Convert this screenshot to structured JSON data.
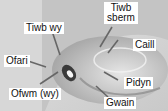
{
  "figure": {
    "labels": [
      {
        "id": "tiwb-wy",
        "text": "Tiwb wy"
      },
      {
        "id": "tiwb-sberm",
        "text": "Tiwb sberm"
      },
      {
        "id": "caill",
        "text": "Caill"
      },
      {
        "id": "ofari",
        "text": "Ofari"
      },
      {
        "id": "pidyn",
        "text": "Pidyn"
      },
      {
        "id": "ofwm-wy",
        "text": "Ofwm (wy)"
      },
      {
        "id": "gwain",
        "text": "Gwain"
      }
    ],
    "colors": {
      "label_bg": "#ffffff",
      "label_text": "#111111",
      "arrow": "#666666"
    }
  }
}
